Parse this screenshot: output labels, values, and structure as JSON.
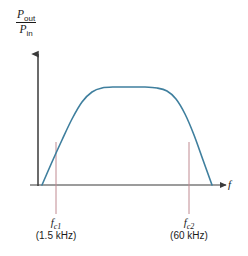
{
  "figure": {
    "type": "frequency-response-curve",
    "background_color": "#ffffff",
    "axis_color": "#3a3a3a",
    "curve_color": "#3f7f9e",
    "marker_color": "#c08a91",
    "text_color": "#1a1a1a"
  },
  "y_axis": {
    "numerator_symbol": "P",
    "numerator_subscript": "out",
    "denominator_symbol": "P",
    "denominator_subscript": "in",
    "arrow": "up"
  },
  "x_axis": {
    "label": "f",
    "arrow": "right"
  },
  "markers": [
    {
      "id": "cutoff-low",
      "symbol": "f",
      "subscript": "c1",
      "value": "(1.5 kHz)",
      "x": 56
    },
    {
      "id": "cutoff-high",
      "symbol": "f",
      "subscript": "c2",
      "value": "(60 kHz)",
      "x": 189
    }
  ],
  "chart_data": {
    "type": "line",
    "title": "",
    "xlabel": "f",
    "ylabel": "P_out / P_in",
    "grid": false,
    "legend": null,
    "annotations": [
      {
        "text": "f_c1 (1.5 kHz)",
        "x_px": 56,
        "note": "lower cutoff frequency"
      },
      {
        "text": "f_c2 (60 kHz)",
        "x_px": 189,
        "note": "upper cutoff frequency"
      }
    ],
    "series": [
      {
        "name": "band-pass response",
        "color": "#3f7f9e",
        "points_px": [
          [
            42,
            185
          ],
          [
            52,
            162
          ],
          [
            62,
            140
          ],
          [
            72,
            119
          ],
          [
            82,
            102
          ],
          [
            92,
            92
          ],
          [
            102,
            88
          ],
          [
            115,
            87
          ],
          [
            130,
            87
          ],
          [
            145,
            87
          ],
          [
            157,
            88
          ],
          [
            167,
            91
          ],
          [
            176,
            99
          ],
          [
            185,
            114
          ],
          [
            194,
            135
          ],
          [
            203,
            160
          ],
          [
            212,
            185
          ]
        ]
      }
    ],
    "axis_origin_px": [
      38,
      185
    ],
    "x_axis_end_px": [
      232,
      185
    ],
    "y_axis_top_px": [
      38,
      48
    ]
  }
}
